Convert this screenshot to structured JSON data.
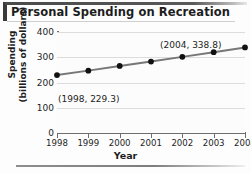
{
  "title": "Personal Spending on Recreation",
  "axes": {
    "xlabel": "Year",
    "ylabel_line1": "Spending",
    "ylabel_line2": "(billions of dollars)"
  },
  "annotations": {
    "first": "(1998, 229.3)",
    "last": "(2004, 338.8)"
  },
  "chart_data": {
    "type": "line",
    "title": "Personal Spending on Recreation",
    "xlabel": "Year",
    "ylabel": "Spending (billions of dollars)",
    "categories": [
      1998,
      1999,
      2000,
      2001,
      2002,
      2003,
      2004
    ],
    "values": [
      229.3,
      247.0,
      265.5,
      283.0,
      301.5,
      320.0,
      338.8
    ],
    "x": [
      1998,
      1999,
      2000,
      2001,
      2002,
      2003,
      2004
    ],
    "xlim": [
      1998,
      2004
    ],
    "ylim": [
      0,
      400
    ],
    "yticks": [
      0,
      100,
      200,
      300,
      400
    ],
    "xticks": [
      1998,
      1999,
      2000,
      2001,
      2002,
      2003,
      2004
    ],
    "grid": true,
    "legend": false,
    "marker": "filled-circle",
    "line_color": "#777777",
    "marker_color": "#111111",
    "annotations": [
      "(1998, 229.3)",
      "(2004, 338.8)"
    ]
  }
}
